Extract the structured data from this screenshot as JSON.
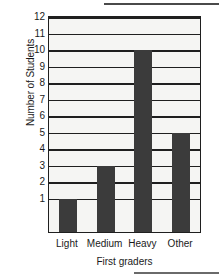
{
  "chart_data": {
    "type": "bar",
    "title": "",
    "xlabel": "First graders",
    "ylabel": "Number of Students",
    "categories": [
      "Light",
      "Medium",
      "Heavy",
      "Other"
    ],
    "values": [
      1,
      3,
      10,
      5
    ],
    "series": [
      {
        "name": "Number of Students",
        "values": [
          1,
          3,
          10,
          5
        ]
      }
    ],
    "ylim": [
      0,
      12
    ],
    "ytick_labels": [
      "12",
      "11",
      "10",
      "9",
      "8",
      "7",
      "6",
      "5",
      "4",
      "3",
      "2",
      "1"
    ],
    "ytick_values": [
      12,
      11,
      10,
      9,
      8,
      7,
      6,
      5,
      4,
      3,
      2,
      1
    ],
    "grid": true,
    "legend": false,
    "legend_position": "none",
    "colors": {
      "bar_fill": "#3b3b3b",
      "plot_background": "#f5f5f3",
      "axis": "#1f1f1f",
      "gridline": "#1f1f1f",
      "text": "#1a1a1a",
      "page_background": "#ffffff"
    }
  }
}
